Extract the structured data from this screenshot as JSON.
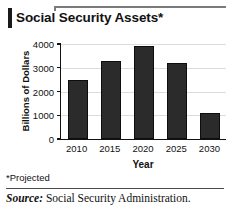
{
  "title": "Social Security Assets*",
  "footnote": "*Projected",
  "source": {
    "label": "Source:",
    "text": "Social Security Administration."
  },
  "chart_data": {
    "type": "bar",
    "title": "Social Security Assets*",
    "categories": [
      "2010",
      "2015",
      "2020",
      "2025",
      "2030"
    ],
    "values": [
      2500,
      3300,
      3900,
      3200,
      1100
    ],
    "xlabel": "Year",
    "ylabel": "Billions of Dollars",
    "ylim": [
      0,
      4000
    ],
    "yticks": [
      0,
      1000,
      2000,
      3000,
      4000
    ],
    "ytick_labels": [
      "0",
      "1000",
      "2000",
      "3000",
      "4000"
    ],
    "grid": true,
    "legend": null,
    "bar_color": "#2b2b2b"
  }
}
